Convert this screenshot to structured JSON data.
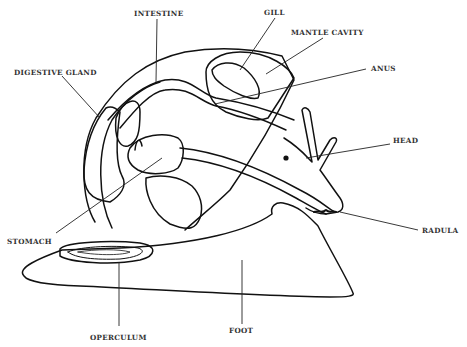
{
  "diagram": {
    "labels": {
      "intestine": "INTESTINE",
      "gill": "GILL",
      "mantle_cavity": "MANTLE CAVITY",
      "digestive_gland": "DIGESTIVE GLAND",
      "anus": "ANUS",
      "head": "HEAD",
      "stomach": "STOMACH",
      "radula": "RADULA",
      "operculum": "OPERCULUM",
      "foot": "FOOT"
    },
    "colors": {
      "ink": "#111111",
      "label": "#333333",
      "background": "#ffffff"
    }
  }
}
